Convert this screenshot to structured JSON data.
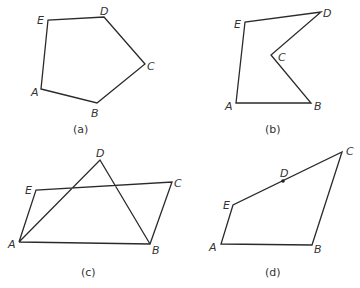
{
  "figures": [
    {
      "id": "a",
      "caption": "(a)",
      "description": "convex pentagon",
      "vertices": {
        "A": {
          "label": "A",
          "x": 41,
          "y": 89
        },
        "B": {
          "label": "B",
          "x": 97,
          "y": 103
        },
        "C": {
          "label": "C",
          "x": 145,
          "y": 64
        },
        "D": {
          "label": "D",
          "x": 104,
          "y": 17
        },
        "E": {
          "label": "E",
          "x": 48,
          "y": 20
        }
      }
    },
    {
      "id": "b",
      "caption": "(b)",
      "description": "concave pentagon",
      "vertices": {
        "A": {
          "label": "A",
          "x": 236,
          "y": 103
        },
        "B": {
          "label": "B",
          "x": 311,
          "y": 103
        },
        "C": {
          "label": "C",
          "x": 271,
          "y": 55
        },
        "D": {
          "label": "D",
          "x": 321,
          "y": 12
        },
        "E": {
          "label": "E",
          "x": 245,
          "y": 22
        }
      }
    },
    {
      "id": "c",
      "caption": "(c)",
      "description": "self-intersecting pentagon",
      "vertices": {
        "A": {
          "label": "A",
          "x": 19,
          "y": 242
        },
        "B": {
          "label": "B",
          "x": 150,
          "y": 244
        },
        "C": {
          "label": "C",
          "x": 172,
          "y": 182
        },
        "D": {
          "label": "D",
          "x": 100,
          "y": 160
        },
        "E": {
          "label": "E",
          "x": 36,
          "y": 190
        }
      }
    },
    {
      "id": "d",
      "caption": "(d)",
      "description": "pentagon with collinear vertex D",
      "vertices": {
        "A": {
          "label": "A",
          "x": 221,
          "y": 244
        },
        "B": {
          "label": "B",
          "x": 312,
          "y": 245
        },
        "C": {
          "label": "C",
          "x": 342,
          "y": 152
        },
        "D": {
          "label": "D",
          "x": 283,
          "y": 181
        },
        "E": {
          "label": "E",
          "x": 233,
          "y": 205
        }
      }
    }
  ]
}
